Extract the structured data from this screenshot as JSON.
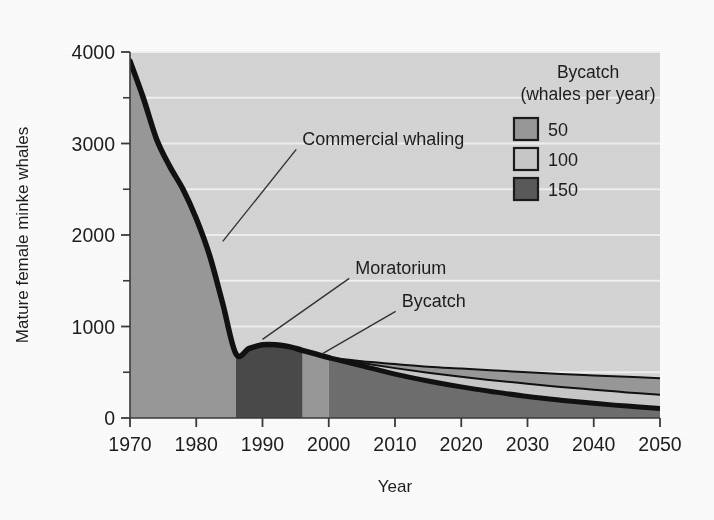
{
  "chart_data": {
    "type": "area",
    "title": "",
    "xlabel": "Year",
    "ylabel": "Mature female minke whales",
    "xlim": [
      1970,
      2050
    ],
    "ylim": [
      0,
      4000
    ],
    "xticks": [
      1970,
      1980,
      1990,
      2000,
      2010,
      2020,
      2030,
      2040,
      2050
    ],
    "xtick_labels": [
      "1970",
      "1980",
      "1990",
      "2000",
      "2010",
      "2020",
      "2030",
      "2040",
      "2050"
    ],
    "yticks": [
      0,
      1000,
      2000,
      3000,
      4000
    ],
    "ytick_labels": [
      "0",
      "1000",
      "2000",
      "3000",
      "4000"
    ],
    "yminor_ticks": [
      500,
      1500,
      2500,
      3500
    ],
    "grid": "horizontal-white-gridlines-every-500",
    "legend_position": "top-right-inside",
    "historic": {
      "name": "Historic population (commercial whaling then moratorium)",
      "x": [
        1970,
        1972,
        1974,
        1976,
        1978,
        1980,
        1982,
        1984,
        1986,
        1988,
        1990,
        1992,
        1994,
        1996,
        1998,
        2000
      ],
      "y": [
        3900,
        3500,
        3050,
        2750,
        2500,
        2180,
        1780,
        1250,
        700,
        760,
        800,
        800,
        780,
        740,
        700,
        660
      ]
    },
    "series": [
      {
        "name": "50",
        "label": "50",
        "color": "#989898",
        "x": [
          2000,
          2005,
          2010,
          2015,
          2020,
          2025,
          2030,
          2035,
          2040,
          2045,
          2050
        ],
        "y": [
          660,
          620,
          590,
          560,
          540,
          520,
          500,
          480,
          465,
          450,
          435
        ]
      },
      {
        "name": "100",
        "label": "100",
        "color": "#c8c8c8",
        "x": [
          2000,
          2005,
          2010,
          2015,
          2020,
          2025,
          2030,
          2035,
          2040,
          2045,
          2050
        ],
        "y": [
          660,
          600,
          545,
          495,
          450,
          410,
          375,
          340,
          310,
          280,
          255
        ]
      },
      {
        "name": "150",
        "label": "150",
        "color": "#5a5a5a",
        "x": [
          2000,
          2005,
          2010,
          2015,
          2020,
          2025,
          2030,
          2035,
          2040,
          2045,
          2050
        ],
        "y": [
          660,
          570,
          480,
          405,
          340,
          285,
          235,
          195,
          160,
          130,
          105
        ]
      }
    ],
    "annotations": [
      {
        "text": "Commercial whaling",
        "x": 1996,
        "y": 2980,
        "leader_to_x": 1984,
        "leader_to_y": 1930
      },
      {
        "text": "Moratorium",
        "x": 2004,
        "y": 1570,
        "leader_to_x": 1990,
        "leader_to_y": 860
      },
      {
        "text": "Bycatch",
        "x": 2011,
        "y": 1210,
        "leader_to_x": 1999,
        "leader_to_y": 700
      }
    ],
    "colors": {
      "plot_background": "#d4d4d4",
      "commercial_whaling_fill": "#989898",
      "moratorium_fill": "#4a4a4a",
      "bycatch_fill": "#6e6e6e",
      "curve": "#111111",
      "gridline": "#f2f2f2",
      "axis": "#3a3a3a",
      "page_background": "#fbfbfb"
    }
  },
  "legend": {
    "title_line1": "Bycatch",
    "title_line2": "(whales per year)",
    "items": [
      {
        "label": "50",
        "color": "#989898"
      },
      {
        "label": "100",
        "color": "#c8c8c8"
      },
      {
        "label": "150",
        "color": "#5a5a5a"
      }
    ]
  },
  "axes": {
    "x_title": "Year",
    "y_title": "Mature female minke whales"
  }
}
